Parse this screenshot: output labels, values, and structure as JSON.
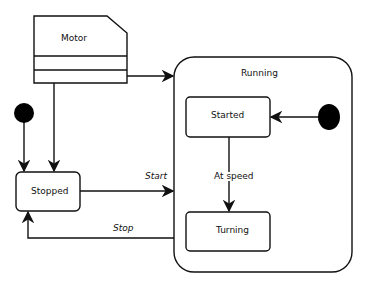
{
  "diagram": {
    "type": "UML state machine",
    "class_box": {
      "label": "Motor"
    },
    "composite_state": {
      "label": "Running"
    },
    "states": [
      {
        "id": "stopped",
        "label": "Stopped"
      },
      {
        "id": "started",
        "label": "Started"
      },
      {
        "id": "turning",
        "label": "Turning"
      }
    ],
    "transitions": [
      {
        "from": "initial-outer",
        "to": "stopped",
        "label": ""
      },
      {
        "from": "motor",
        "to": "stopped",
        "label": ""
      },
      {
        "from": "motor",
        "to": "running",
        "label": ""
      },
      {
        "from": "stopped",
        "to": "running",
        "label": "Start"
      },
      {
        "from": "running",
        "to": "stopped",
        "label": "Stop"
      },
      {
        "from": "initial-inner",
        "to": "started",
        "label": ""
      },
      {
        "from": "started",
        "to": "turning",
        "label": "At speed"
      }
    ],
    "colors": {
      "stroke": "#111111",
      "fill": "#ffffff",
      "initial": "#000000"
    }
  }
}
